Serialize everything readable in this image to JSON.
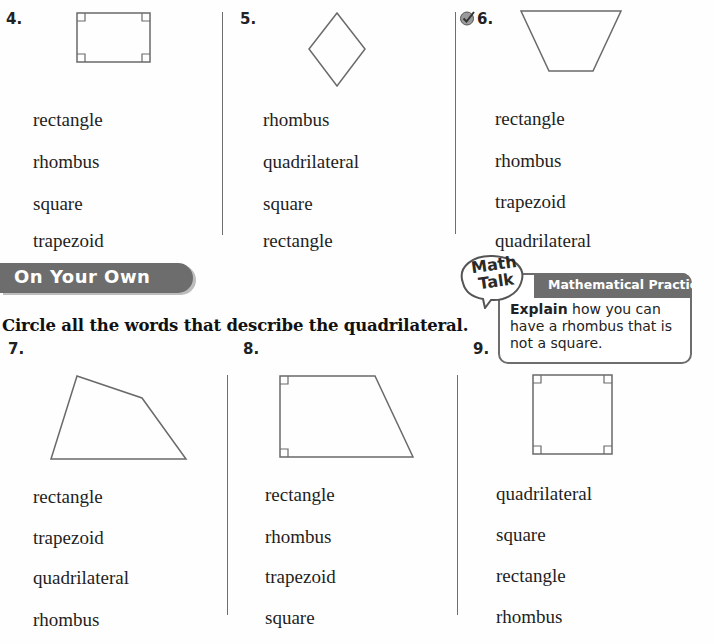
{
  "top_section": {
    "problems": [
      {
        "number": "4.",
        "shape": "rectangle with four right-angle marks",
        "choices": [
          "rectangle",
          "rhombus",
          "square",
          "trapezoid"
        ]
      },
      {
        "number": "5.",
        "shape": "rhombus (diamond)",
        "choices": [
          "rhombus",
          "quadrilateral",
          "square",
          "rectangle"
        ]
      },
      {
        "number": "6.",
        "shape": "trapezoid (wide top, narrow bottom)",
        "check_icon": "checkmark-circle-icon",
        "choices": [
          "rectangle",
          "rhombus",
          "trapezoid",
          "quadrilateral"
        ]
      }
    ]
  },
  "math_talk": {
    "bubble_line1": "Math",
    "bubble_line2": "Talk",
    "header": "Mathematical Practices",
    "body_bold": "Explain",
    "body_rest": " how you can have a rhombus that is not a square."
  },
  "on_your_own": {
    "banner": "On Your Own",
    "instruction": "Circle all the words that describe the quadrilateral.",
    "problems": [
      {
        "number": "7.",
        "shape": "irregular quadrilateral",
        "choices": [
          "rectangle",
          "trapezoid",
          "quadrilateral",
          "rhombus"
        ]
      },
      {
        "number": "8.",
        "shape": "right trapezoid with two right-angle marks",
        "choices": [
          "rectangle",
          "rhombus",
          "trapezoid",
          "square"
        ]
      },
      {
        "number": "9.",
        "shape": "square with four right-angle marks",
        "choices": [
          "quadrilateral",
          "square",
          "rectangle",
          "rhombus"
        ]
      }
    ]
  },
  "colors": {
    "banner_bg": "#6d6d6d",
    "line": "#6e6e6e",
    "shape_stroke": "#6a6a6a"
  }
}
